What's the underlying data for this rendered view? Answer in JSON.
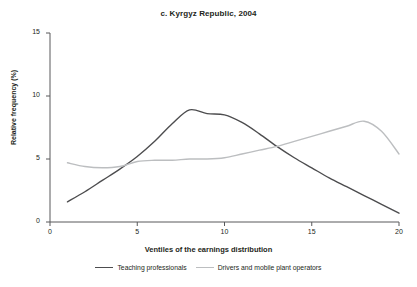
{
  "chart_data": {
    "type": "line",
    "title": "c. Kyrgyz Republic, 2004",
    "xlabel": "Ventiles of the earnings distribution",
    "ylabel": "Relative frequency (%)",
    "xlim": [
      0,
      20
    ],
    "ylim": [
      0,
      15
    ],
    "xticks": [
      0,
      5,
      10,
      15,
      20
    ],
    "yticks": [
      0,
      5,
      10,
      15
    ],
    "xtick_labels": [
      "0",
      "5",
      "10",
      "15",
      "20"
    ],
    "ytick_labels": [
      "0",
      "5",
      "10",
      "15"
    ],
    "grid": false,
    "legend_position": "bottom",
    "x": [
      1,
      2,
      3,
      4,
      5,
      6,
      7,
      8,
      9,
      10,
      11,
      12,
      13,
      14,
      15,
      16,
      17,
      18,
      19,
      20
    ],
    "series": [
      {
        "name": "Teaching professionals",
        "color": "#4d4d4f",
        "values": [
          1.6,
          2.4,
          3.3,
          4.2,
          5.2,
          6.4,
          7.8,
          8.9,
          8.6,
          8.5,
          7.9,
          7.0,
          6.0,
          5.1,
          4.3,
          3.5,
          2.8,
          2.1,
          1.4,
          0.7
        ]
      },
      {
        "name": "Drivers and mobile plant operators",
        "color": "#bcbec0",
        "values": [
          4.7,
          4.4,
          4.3,
          4.4,
          4.8,
          4.9,
          4.9,
          5.0,
          5.0,
          5.1,
          5.4,
          5.7,
          6.0,
          6.4,
          6.8,
          7.2,
          7.6,
          8.0,
          7.2,
          5.4
        ]
      }
    ]
  },
  "legend": {
    "items": [
      {
        "label": "Teaching professionals"
      },
      {
        "label": "Drivers and mobile plant operators"
      }
    ]
  },
  "colors": {
    "series_0": "#4d4d4f",
    "series_1": "#bcbec0",
    "axis": "#58595b",
    "text": "#231f20",
    "background": "#ffffff"
  }
}
